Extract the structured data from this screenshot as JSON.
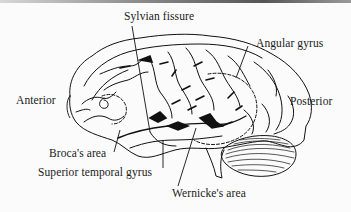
{
  "figure": {
    "type": "lateral view of left cerebral hemisphere",
    "labels": {
      "sylvian_fissure": "Sylvian fissure",
      "angular_gyrus": "Angular gyrus",
      "anterior": "Anterior",
      "posterior": "Posterior",
      "brocas_area": "Broca's area",
      "superior_temporal_gyrus": "Superior temporal gyrus",
      "wernickes_area": "Wernicke's area"
    },
    "colors": {
      "ink": "#111111",
      "paper": "#fbfbfb"
    }
  }
}
